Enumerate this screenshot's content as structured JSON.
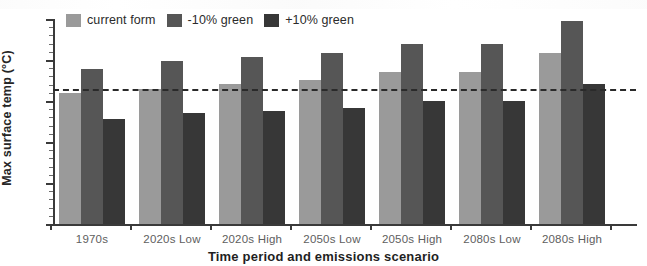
{
  "chart_data": {
    "type": "bar",
    "title": "",
    "xlabel": "Time period and emissions scenario",
    "ylabel": "Max surface temp (°C)",
    "categories": [
      "1970s",
      "2020s Low",
      "2020s High",
      "2050s Low",
      "2050s High",
      "2080s Low",
      "2080s High"
    ],
    "series": [
      {
        "name": "current form",
        "color": "#9a9a9a",
        "values": [
          31.0,
          31.5,
          32.1,
          32.6,
          33.5,
          33.5,
          35.9
        ]
      },
      {
        "name": "-10% green",
        "color": "#565656",
        "values": [
          33.9,
          34.9,
          35.4,
          35.8,
          37.0,
          37.0,
          39.7
        ]
      },
      {
        "name": "+10% green",
        "color": "#373737",
        "values": [
          27.8,
          28.5,
          28.8,
          29.1,
          30.0,
          30.0,
          32.1
        ]
      }
    ],
    "ylim": [
      15,
      40
    ],
    "ytick_values": [
      15,
      20,
      25,
      30,
      35,
      40
    ],
    "ytick_labels": [
      "15",
      "20",
      "25",
      "30",
      "35",
      "40"
    ],
    "ytick_minor_step": 1,
    "grid": false,
    "legend_position": "top-left-inside",
    "reference_line": {
      "name": "1970s current form baseline",
      "value": 31.5,
      "style": "dashed",
      "color": "#2a2a2a"
    }
  },
  "legend": {
    "items": [
      {
        "label": "current form",
        "color": "#9a9a9a"
      },
      {
        "label": "-10% green",
        "color": "#565656"
      },
      {
        "label": "+10% green",
        "color": "#373737"
      }
    ]
  }
}
